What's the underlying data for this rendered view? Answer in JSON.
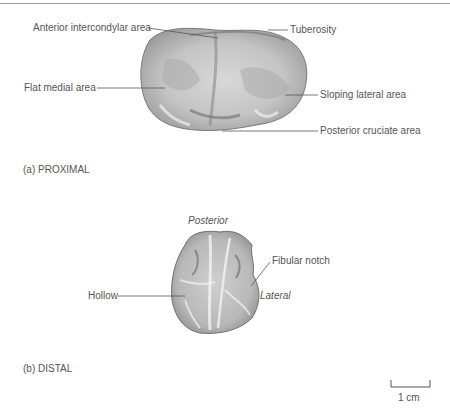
{
  "figure": {
    "panel_a": {
      "caption": "(a) PROXIMAL",
      "labels": {
        "anterior_intercondylar": "Anterior intercondylar area",
        "tuberosity": "Tuberosity",
        "flat_medial": "Flat medial area",
        "sloping_lateral": "Sloping lateral area",
        "posterior_cruciate": "Posterior cruciate area"
      }
    },
    "panel_b": {
      "caption": "(b) DISTAL",
      "labels": {
        "posterior": "Posterior",
        "fibular_notch": "Fibular notch",
        "hollow": "Hollow",
        "lateral": "Lateral"
      }
    },
    "scale_bar": {
      "label": "1 cm"
    }
  }
}
